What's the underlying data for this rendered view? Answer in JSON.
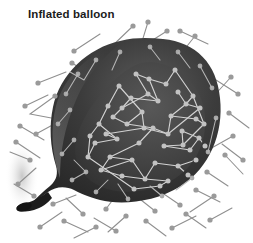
{
  "figure": {
    "title": "Inflated balloon",
    "subject": "balloon",
    "illustration_type": "cutaway-diagram",
    "depicts": "gas particles in random motion inside and outside an inflated balloon"
  },
  "colors": {
    "background": "#ffffff",
    "title_text": "#1b1b1b",
    "balloon_body_dark": "#2e2e2e",
    "balloon_body_mid": "#4a4a4a",
    "balloon_body_light": "#6d6d6d",
    "balloon_rim_highlight": "#7b7b7b",
    "cavity_dark": "#3b3b3b",
    "cavity_mid": "#4f4f4f",
    "knot": "#1a1a1a",
    "particle_inside": "#bdbdbd",
    "particle_outside": "#9a9a9a",
    "path_inside": "#d2d2d2",
    "path_outside": "#8f8f8f",
    "shadow": "#d9d9d9"
  },
  "geometry": {
    "canvas": {
      "width": 253,
      "height": 243
    },
    "balloon_outline": "M 163 39 C 196 42 217 64 220 98 C 224 134 209 168 181 186 C 154 203 120 205 100 200 C 88 197 80 193 74 190 C 66 186 56 186 48 192 C 40 198 33 203 30 205 C 36 198 44 191 50 186 C 57 180 58 173 56 166 C 50 147 49 126 53 107 C 60 74 88 48 120 41 C 136 37 150 38 163 39 Z",
    "cavity_outline": "M 152 62 C 188 66 208 96 205 128 C 202 160 180 182 150 189 C 120 196 95 189 83 173 C 72 158 73 140 84 119 C 96 96 120 71 138 64 C 143 62 148 62 152 62 Z",
    "knot": {
      "cx": 26,
      "cy": 206,
      "rx": 9,
      "ry": 5
    },
    "shadow_ellipse": {
      "cx": 22,
      "cy": 176,
      "rx": 16,
      "ry": 34
    }
  },
  "particles_inside": [
    {
      "x": 166,
      "y": 84
    },
    {
      "x": 149,
      "y": 79
    },
    {
      "x": 178,
      "y": 92
    },
    {
      "x": 131,
      "y": 98
    },
    {
      "x": 158,
      "y": 101
    },
    {
      "x": 186,
      "y": 104
    },
    {
      "x": 119,
      "y": 86
    },
    {
      "x": 142,
      "y": 112
    },
    {
      "x": 171,
      "y": 116
    },
    {
      "x": 196,
      "y": 119
    },
    {
      "x": 108,
      "y": 106
    },
    {
      "x": 127,
      "y": 124
    },
    {
      "x": 153,
      "y": 128
    },
    {
      "x": 182,
      "y": 131
    },
    {
      "x": 199,
      "y": 138
    },
    {
      "x": 99,
      "y": 124
    },
    {
      "x": 117,
      "y": 139
    },
    {
      "x": 139,
      "y": 143
    },
    {
      "x": 164,
      "y": 146
    },
    {
      "x": 190,
      "y": 150
    },
    {
      "x": 95,
      "y": 143
    },
    {
      "x": 110,
      "y": 157
    },
    {
      "x": 132,
      "y": 160
    },
    {
      "x": 155,
      "y": 163
    },
    {
      "x": 178,
      "y": 166
    },
    {
      "x": 196,
      "y": 160
    },
    {
      "x": 101,
      "y": 170
    },
    {
      "x": 122,
      "y": 176
    },
    {
      "x": 145,
      "y": 179
    },
    {
      "x": 168,
      "y": 181
    },
    {
      "x": 188,
      "y": 175
    },
    {
      "x": 113,
      "y": 117
    },
    {
      "x": 175,
      "y": 70
    },
    {
      "x": 193,
      "y": 96
    },
    {
      "x": 136,
      "y": 74
    },
    {
      "x": 204,
      "y": 124
    },
    {
      "x": 88,
      "y": 157
    },
    {
      "x": 160,
      "y": 186
    },
    {
      "x": 134,
      "y": 189
    },
    {
      "x": 205,
      "y": 146
    },
    {
      "x": 148,
      "y": 94
    },
    {
      "x": 122,
      "y": 108
    },
    {
      "x": 200,
      "y": 108
    },
    {
      "x": 168,
      "y": 134
    },
    {
      "x": 106,
      "y": 134
    },
    {
      "x": 183,
      "y": 145
    },
    {
      "x": 144,
      "y": 128
    },
    {
      "x": 90,
      "y": 136
    }
  ],
  "particles_outside": [
    {
      "x": 133,
      "y": 26
    },
    {
      "x": 167,
      "y": 31
    },
    {
      "x": 180,
      "y": 31
    },
    {
      "x": 195,
      "y": 36
    },
    {
      "x": 74,
      "y": 51
    },
    {
      "x": 72,
      "y": 63
    },
    {
      "x": 38,
      "y": 83
    },
    {
      "x": 55,
      "y": 96
    },
    {
      "x": 25,
      "y": 106
    },
    {
      "x": 20,
      "y": 126
    },
    {
      "x": 16,
      "y": 142
    },
    {
      "x": 36,
      "y": 134
    },
    {
      "x": 231,
      "y": 77
    },
    {
      "x": 238,
      "y": 94
    },
    {
      "x": 229,
      "y": 113
    },
    {
      "x": 233,
      "y": 136
    },
    {
      "x": 225,
      "y": 155
    },
    {
      "x": 207,
      "y": 172
    },
    {
      "x": 196,
      "y": 190
    },
    {
      "x": 214,
      "y": 196
    },
    {
      "x": 180,
      "y": 205
    },
    {
      "x": 155,
      "y": 211
    },
    {
      "x": 146,
      "y": 221
    },
    {
      "x": 126,
      "y": 216
    },
    {
      "x": 106,
      "y": 209
    },
    {
      "x": 83,
      "y": 214
    },
    {
      "x": 64,
      "y": 221
    },
    {
      "x": 40,
      "y": 227
    },
    {
      "x": 53,
      "y": 204
    },
    {
      "x": 34,
      "y": 196
    },
    {
      "x": 18,
      "y": 184
    },
    {
      "x": 116,
      "y": 231
    },
    {
      "x": 172,
      "y": 228
    },
    {
      "x": 210,
      "y": 220
    },
    {
      "x": 96,
      "y": 227
    },
    {
      "x": 243,
      "y": 160
    }
  ],
  "legend": {
    "particle_label": "gas particle",
    "path_label": "particle path"
  }
}
